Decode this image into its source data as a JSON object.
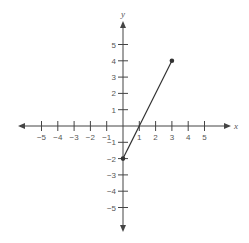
{
  "chart_data": {
    "type": "line",
    "title": "",
    "xlabel": "x",
    "ylabel": "y",
    "xlim": [
      -5,
      5
    ],
    "ylim": [
      -5,
      5
    ],
    "x_ticks": [
      -5,
      -4,
      -3,
      -2,
      -1,
      1,
      2,
      3,
      4,
      5
    ],
    "y_ticks": [
      -5,
      -4,
      -3,
      -2,
      -1,
      1,
      2,
      3,
      4,
      5
    ],
    "x_tick_labels": [
      "−5",
      "−4",
      "−3",
      "−2",
      "−1",
      "1",
      "2",
      "3",
      "4",
      "5"
    ],
    "y_tick_labels": [
      "−5",
      "−4",
      "−3",
      "−2",
      "−1",
      "1",
      "2",
      "3",
      "4",
      "5"
    ],
    "grid": false,
    "axes_arrows": true,
    "series": [
      {
        "name": "segment",
        "x": [
          0,
          3
        ],
        "y": [
          -2,
          4
        ],
        "endpoints": "closed",
        "color": "#333333"
      }
    ]
  },
  "colors": {
    "axis": "#444444",
    "line": "#333333",
    "text": "#555555"
  }
}
